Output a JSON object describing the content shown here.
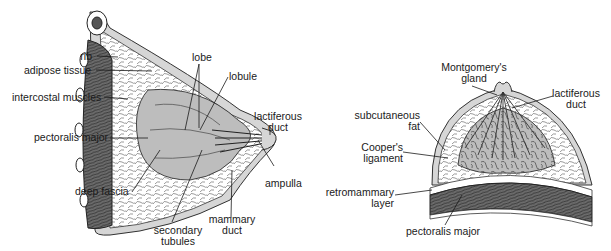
{
  "figure": {
    "left_panel": {
      "name": "sagittal-section",
      "labels": {
        "rib": "rib",
        "adipose_tissue": "adipose tissue",
        "intercostal_muscles": "intercostal muscles",
        "pectoralis_major": "pectoralis major",
        "deep_fascia": "deep fascia",
        "lobe": "lobe",
        "lobule": "lobule",
        "lactiferous_duct_1": "lactiferous",
        "lactiferous_duct_2": "duct",
        "ampulla": "ampulla",
        "mammary_duct_1": "mammary",
        "mammary_duct_2": "duct",
        "secondary_tubules_1": "secondary",
        "secondary_tubules_2": "tubules"
      }
    },
    "right_panel": {
      "name": "transverse-section",
      "labels": {
        "montgomery_1": "Montgomery's",
        "montgomery_2": "gland",
        "lactiferous_duct_1": "lactiferous",
        "lactiferous_duct_2": "duct",
        "subcutaneous_fat_1": "subcutaneous",
        "subcutaneous_fat_2": "fat",
        "coopers_ligament_1": "Cooper's",
        "coopers_ligament_2": "ligament",
        "retromammary_1": "retromammary",
        "retromammary_2": "layer",
        "pectoralis_major": "pectoralis major"
      }
    },
    "colors": {
      "outline": "#333333",
      "skin": "#d6d6d6",
      "gland": "#bdbdbd",
      "muscle": "#6e6e6e",
      "fat": "#ffffff"
    }
  }
}
